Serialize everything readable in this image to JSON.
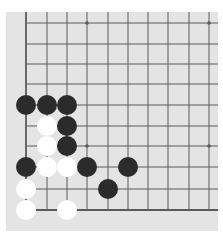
{
  "game": {
    "type": "go",
    "view": "bottom-left corner section",
    "grid": {
      "columns": 10,
      "rows": 10,
      "col_x": [
        26,
        47,
        67,
        87,
        108,
        128,
        148,
        168,
        189,
        209
      ],
      "row_y": [
        23,
        44,
        64,
        84,
        105,
        126,
        146,
        167,
        189,
        210
      ],
      "edges": [
        "left",
        "bottom"
      ]
    },
    "star_points": [
      [
        3,
        0
      ],
      [
        9,
        0
      ],
      [
        3,
        6
      ],
      [
        9,
        6
      ]
    ],
    "stones": [
      {
        "color": "black",
        "col": 0,
        "row": 4
      },
      {
        "color": "black",
        "col": 1,
        "row": 4
      },
      {
        "color": "black",
        "col": 2,
        "row": 4
      },
      {
        "color": "white",
        "col": 1,
        "row": 5
      },
      {
        "color": "black",
        "col": 2,
        "row": 5
      },
      {
        "color": "white",
        "col": 1,
        "row": 6
      },
      {
        "color": "black",
        "col": 2,
        "row": 6
      },
      {
        "color": "black",
        "col": 0,
        "row": 7
      },
      {
        "color": "white",
        "col": 1,
        "row": 7
      },
      {
        "color": "white",
        "col": 2,
        "row": 7
      },
      {
        "color": "black",
        "col": 3,
        "row": 7
      },
      {
        "color": "black",
        "col": 5,
        "row": 7
      },
      {
        "color": "white",
        "col": 0,
        "row": 8
      },
      {
        "color": "black",
        "col": 4,
        "row": 8
      },
      {
        "color": "white",
        "col": 0,
        "row": 9
      },
      {
        "color": "white",
        "col": 2,
        "row": 9
      }
    ],
    "colors": {
      "board": "#e4e4e4",
      "line": "#5a5a5a",
      "black_stone": "#2b2b2b",
      "white_stone": "#ffffff"
    }
  }
}
